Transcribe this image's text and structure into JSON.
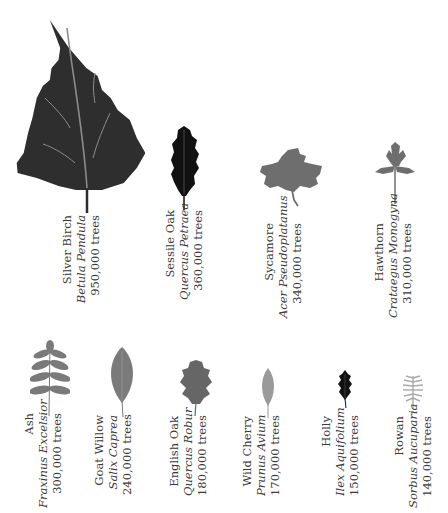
{
  "colors": {
    "dark": "#2e2e2e",
    "mid": "#6e6e6e",
    "light": "#8a8a8a",
    "pale": "#a8a8a8",
    "black": "#111111",
    "vein": "#8c8c8c"
  },
  "trees": [
    {
      "common": "Silver Birch",
      "scientific": "Betula Pendula",
      "count": "950,000 trees",
      "leaf_icon": "birch-leaf-icon"
    },
    {
      "common": "Sessile Oak",
      "scientific": "Quercus Petraea",
      "count": "360,000 trees",
      "leaf_icon": "sessile-oak-leaf-icon"
    },
    {
      "common": "Sycamore",
      "scientific": "Acer Pseudoplatanus",
      "count": "340,000 trees",
      "leaf_icon": "sycamore-leaf-icon"
    },
    {
      "common": "Hawthorn",
      "scientific": "Crataegus Monogyna",
      "count": "310,000 trees",
      "leaf_icon": "hawthorn-leaf-icon"
    },
    {
      "common": "Ash",
      "scientific": "Fraxinus Excelsior",
      "count": "300,000 trees",
      "leaf_icon": "ash-leaf-icon"
    },
    {
      "common": "Goat Willow",
      "scientific": "Salix Caprea",
      "count": "240,000 trees",
      "leaf_icon": "willow-leaf-icon"
    },
    {
      "common": "English Oak",
      "scientific": "Quercus Robur",
      "count": "180,000 trees",
      "leaf_icon": "english-oak-leaf-icon"
    },
    {
      "common": "Wild Cherry",
      "scientific": "Prunus Avium",
      "count": "170,000 trees",
      "leaf_icon": "cherry-leaf-icon"
    },
    {
      "common": "Holly",
      "scientific": "Ilex Aquifolium",
      "count": "150,000 trees",
      "leaf_icon": "holly-leaf-icon"
    },
    {
      "common": "Rowan",
      "scientific": "Sorbus Aucuparia",
      "count": "140,000 trees",
      "leaf_icon": "rowan-leaf-icon"
    }
  ]
}
